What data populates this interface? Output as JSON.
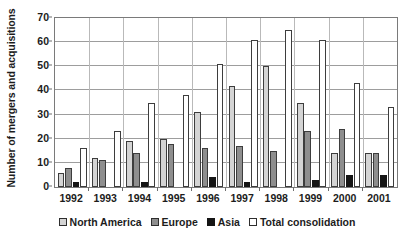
{
  "chart_data": {
    "type": "bar",
    "title": "",
    "xlabel": "",
    "ylabel": "Number of mergers and acquisitions",
    "ylim": [
      0,
      70
    ],
    "yticks": [
      0,
      10,
      20,
      30,
      40,
      50,
      60,
      70
    ],
    "grid": true,
    "legend_position": "bottom",
    "categories": [
      "1992",
      "1993",
      "1994",
      "1995",
      "1996",
      "1997",
      "1998",
      "1999",
      "2000",
      "2001"
    ],
    "series": [
      {
        "name": "North America",
        "color": "#d4d4d4",
        "values": [
          6,
          12,
          19,
          20,
          31,
          42,
          50,
          35,
          14,
          14
        ]
      },
      {
        "name": "Europe",
        "color": "#8e8e8e",
        "values": [
          8,
          11,
          14,
          18,
          16,
          17,
          15,
          23,
          24,
          14
        ]
      },
      {
        "name": "Asia",
        "color": "#151515",
        "values": [
          2,
          0,
          2,
          0,
          4,
          2,
          0,
          3,
          5,
          5
        ]
      },
      {
        "name": "Total consolidation",
        "color": "#ffffff",
        "values": [
          16,
          23,
          35,
          38,
          51,
          61,
          65,
          61,
          43,
          33
        ]
      }
    ]
  }
}
